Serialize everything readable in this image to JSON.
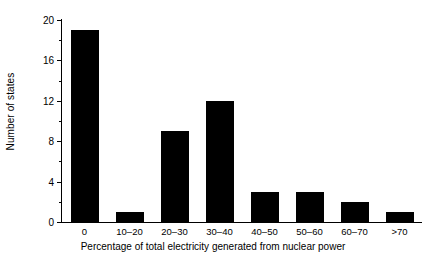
{
  "chart_data": {
    "type": "bar",
    "title": "",
    "xlabel": "Percentage of total electricity generated from nuclear power",
    "ylabel": "Number of states",
    "categories": [
      "0",
      "10–20",
      "20–30",
      "30–40",
      "40–50",
      "50–60",
      "60–70",
      ">70"
    ],
    "values": [
      19,
      1,
      9,
      12,
      3,
      3,
      2,
      1
    ],
    "ylim": [
      0,
      20
    ],
    "ytick_labels": [
      "0",
      "4",
      "8",
      "12",
      "16",
      "20"
    ],
    "ytick_values": [
      0,
      4,
      8,
      12,
      16,
      20
    ],
    "yminor_tick_values": [
      2,
      6,
      10,
      14,
      18
    ],
    "grid": false,
    "legend": false,
    "bar_color": "#000000",
    "axis_color": "#000000",
    "background": "#ffffff"
  }
}
